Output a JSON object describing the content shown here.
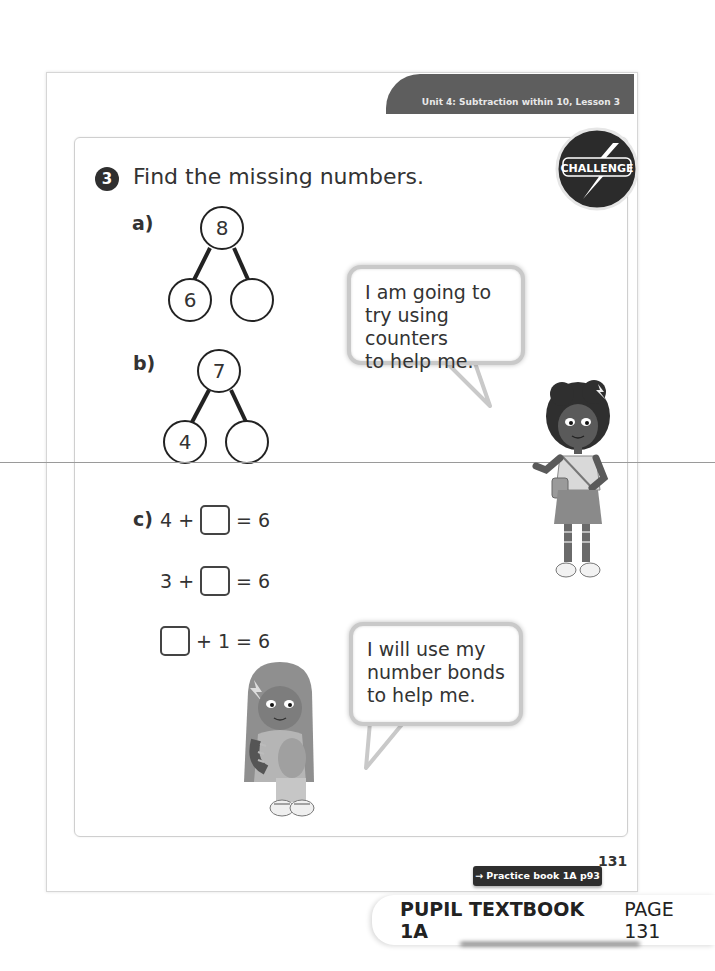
{
  "header": {
    "unit_banner": "Unit 4: Subtraction within 10, Lesson 3",
    "challenge_badge": "CHALLENGE"
  },
  "question": {
    "number": "3",
    "prompt": "Find the missing numbers."
  },
  "parts": {
    "a": {
      "label": "a)",
      "whole": "8",
      "part_left": "6",
      "part_right": ""
    },
    "b": {
      "label": "b)",
      "whole": "7",
      "part_left": "4",
      "part_right": ""
    },
    "c": {
      "label": "c)",
      "equations": [
        {
          "left": "4 +",
          "right": "= 6"
        },
        {
          "left": "3 +",
          "right": "= 6"
        },
        {
          "left": "",
          "right": "+ 1 = 6"
        }
      ]
    }
  },
  "speech": {
    "bubble1": [
      "I am going to",
      "try using counters",
      "to help me."
    ],
    "bubble2": [
      "I will use my",
      "number bonds",
      "to help me."
    ]
  },
  "footer": {
    "page_number": "131",
    "practice_link": "→ Practice book 1A p93",
    "textbook_bold": "PUPIL TEXTBOOK 1A",
    "textbook_page": "PAGE 131"
  },
  "colors": {
    "banner": "#5e5e5e",
    "dark_badge": "#2e2e2e",
    "border": "#cfcfcf"
  }
}
